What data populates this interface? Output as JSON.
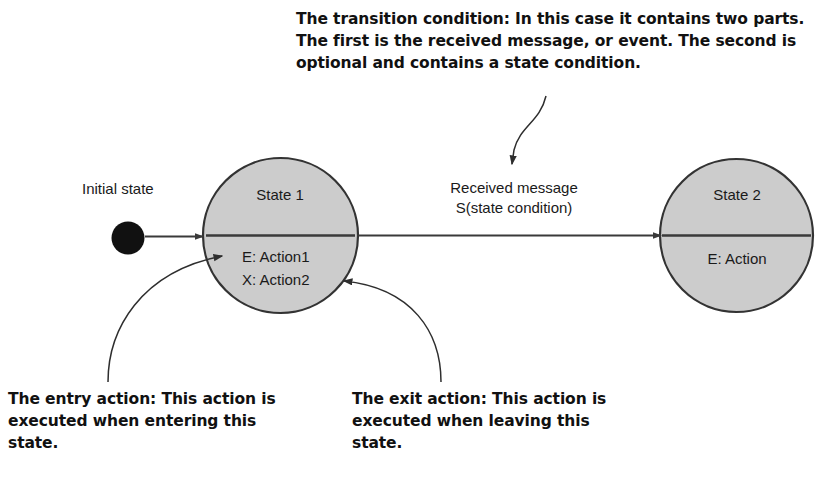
{
  "diagram": {
    "title_callouts": {
      "transition": "The transition condition: In this case it contains two parts. The first is the received message, or event. The second is optional and contains a state condition.",
      "entry": "The entry action: This action is executed when entering this state.",
      "exit": "The exit action: This action is executed when leaving this state."
    },
    "initial_state_label": "Initial state",
    "transition_label": "Received message\nS(state condition)",
    "states": [
      {
        "name": "State 1",
        "actions": "E: Action1\nX: Action2"
      },
      {
        "name": "State 2",
        "actions": "E: Action"
      }
    ],
    "colors": {
      "state_fill": "#cccccc",
      "state_stroke": "#333333",
      "line": "#3a3a3a",
      "initial_dot": "#111111",
      "text": "#1a1a1a",
      "callout_text": "#111111",
      "background": "#ffffff"
    }
  }
}
